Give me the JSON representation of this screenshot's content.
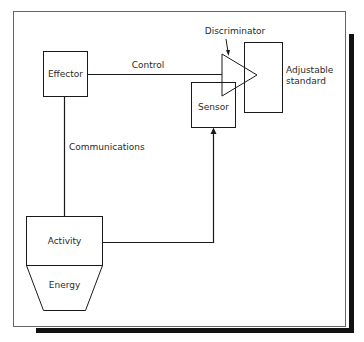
{
  "diagram": {
    "type": "control-system-block-diagram",
    "nodes": {
      "effector": {
        "label": "Effector"
      },
      "discriminator": {
        "label": "Discriminator"
      },
      "adjustable_standard": {
        "label_line1": "Adjustable",
        "label_line2": "standard"
      },
      "sensor": {
        "label": "Sensor"
      },
      "activity": {
        "label": "Activity"
      },
      "energy": {
        "label": "Energy"
      }
    },
    "edges": {
      "control": {
        "label": "Control",
        "from": "Effector",
        "to": "Discriminator"
      },
      "communications": {
        "label": "Communications",
        "from": "Effector",
        "to": "Activity"
      },
      "feedback": {
        "label": "",
        "from": "Activity",
        "to": "Sensor"
      }
    },
    "colors": {
      "line": "#1a1a1a",
      "frame": "#555555",
      "shadow": "#111111",
      "background": "#ffffff"
    }
  }
}
